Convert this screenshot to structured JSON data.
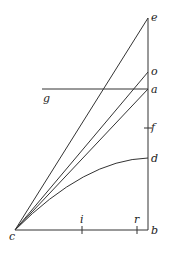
{
  "diagram": {
    "type": "geometric-figure",
    "points": {
      "c": {
        "label": "c",
        "x": 15,
        "y": 230
      },
      "b": {
        "label": "b",
        "x": 148,
        "y": 230
      },
      "e": {
        "label": "e",
        "x": 148,
        "y": 18
      },
      "o": {
        "label": "o",
        "x": 148,
        "y": 72
      },
      "a": {
        "label": "a",
        "x": 148,
        "y": 89
      },
      "f": {
        "label": "f",
        "x": 148,
        "y": 128
      },
      "d": {
        "label": "d",
        "x": 148,
        "y": 158
      },
      "g": {
        "label": "g",
        "x": 42,
        "y": 89
      },
      "i": {
        "label": "i",
        "x": 82,
        "y": 230
      },
      "r": {
        "label": "r",
        "x": 137,
        "y": 230
      }
    },
    "labels": {
      "e": "e",
      "o": "o",
      "a": "a",
      "f": "f",
      "d": "d",
      "b": "b",
      "c": "c",
      "g": "g",
      "i": "i",
      "r": "r"
    },
    "segments": [
      {
        "from": "c",
        "to": "b",
        "desc": "baseline"
      },
      {
        "from": "b",
        "to": "e",
        "desc": "vertical line"
      },
      {
        "from": "c",
        "to": "e"
      },
      {
        "from": "c",
        "to": "o"
      },
      {
        "from": "c",
        "to": "a"
      },
      {
        "from": "g",
        "to": "a",
        "desc": "horizontal line"
      }
    ],
    "curves": [
      {
        "from": "c",
        "to": "d",
        "desc": "concave curve"
      }
    ],
    "ticks": [
      "i",
      "r",
      "f"
    ]
  }
}
